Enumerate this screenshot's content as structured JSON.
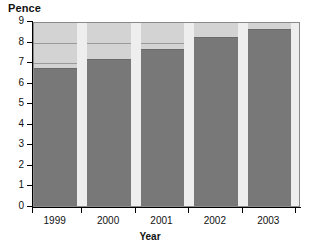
{
  "chart_data": {
    "type": "bar",
    "title": "",
    "categories": [
      "1999",
      "2000",
      "2001",
      "2002",
      "2003"
    ],
    "values": [
      6.7,
      7.15,
      7.65,
      8.2,
      8.6
    ],
    "series": [
      {
        "name": "Pence",
        "values": [
          6.7,
          7.15,
          7.65,
          8.2,
          8.6
        ]
      }
    ],
    "xlabel": "Year",
    "ylabel": "Pence",
    "ylim": [
      0,
      9
    ],
    "yticks": [
      "0",
      "1",
      "2",
      "3",
      "4",
      "5",
      "6",
      "7",
      "8",
      "9"
    ],
    "grid": true,
    "legend": false,
    "legend_position": "none",
    "colors": {
      "bar": "#787878",
      "plot_background": "#d3d3d3",
      "gridline": "#9a9a9a",
      "gap_band": "#eeeeee",
      "axis": "#000000",
      "text": "#111111"
    }
  },
  "watermark": {
    "text": ""
  }
}
